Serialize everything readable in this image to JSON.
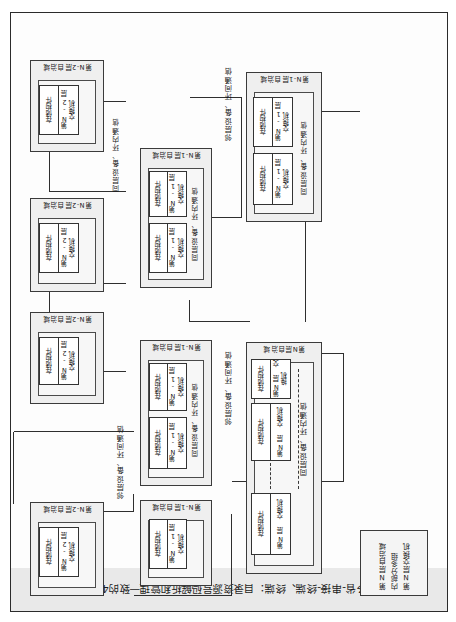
{
  "figure": {
    "caption": "多省-串接-终端、终端：目录资源号码解析和管理一致的4层",
    "note_box": {
      "lines": [
        "第N层自治域",
        "内部分多组",
        "第N层交换机"
      ]
    },
    "link_labels": {
      "intra_ring": "同层设备、环内通信",
      "inter_ring": "邻层设备、环间通信"
    },
    "domains": [
      {
        "id": "layer-n",
        "label": "第N层自治域",
        "nodes": [
          {
            "storage": "存储构件",
            "switch": "第N层\n交换机"
          },
          {
            "storage": "存储构件",
            "switch": "第N层\n交换机"
          },
          {
            "storage": "存储构件",
            "switch": "第N层\n交换机"
          }
        ]
      },
      {
        "id": "layer-n1-a",
        "label": "第N-1层自治域",
        "nodes": [
          {
            "storage": "存储构件",
            "switch": "第N-1层\n交换机"
          }
        ]
      },
      {
        "id": "layer-n1-b",
        "label": "第N-1层自治域",
        "nodes": [
          {
            "storage": "存储构件",
            "switch": "第N-1层\n交换机"
          },
          {
            "storage": "存储构件",
            "switch": "第N-1层\n交换机"
          }
        ]
      },
      {
        "id": "layer-n1-c",
        "label": "第N-1层自治域",
        "nodes": [
          {
            "storage": "存储构件",
            "switch": "第N-1层\n交换机"
          },
          {
            "storage": "存储构件",
            "switch": "第N-1层\n交换机"
          }
        ]
      },
      {
        "id": "layer-n1-d",
        "label": "第N-1层自治域",
        "nodes": [
          {
            "storage": "存储构件",
            "switch": "第N-1层\n交换机"
          },
          {
            "storage": "存储构件",
            "switch": "第N-1层\n交换机"
          }
        ]
      },
      {
        "id": "layer-n2-a",
        "label": "第N-2层自治域",
        "nodes": [
          {
            "storage": "存储构件",
            "switch": "第N-2层\n交换机"
          }
        ]
      },
      {
        "id": "layer-n2-b",
        "label": "第N-2层自治域",
        "nodes": [
          {
            "storage": "存储构件",
            "switch": "第N-2层\n交换机"
          }
        ]
      },
      {
        "id": "layer-n2-c",
        "label": "第N-2层自治域",
        "nodes": [
          {
            "storage": "存储构件",
            "switch": "第N-2层\n交换机"
          }
        ]
      },
      {
        "id": "layer-n2-d",
        "label": "第N-2层自治域",
        "nodes": [
          {
            "storage": "存储构件",
            "switch": "第N-2层\n交换机"
          }
        ]
      }
    ],
    "colors": {
      "page_bg": "#ffffff",
      "frame_line": "#2b2b2b",
      "caption_bg": "#e9e9e9",
      "domain_fill": "#efefef",
      "node_fill": "#ffffff",
      "wire": "#2f2f2f"
    }
  }
}
